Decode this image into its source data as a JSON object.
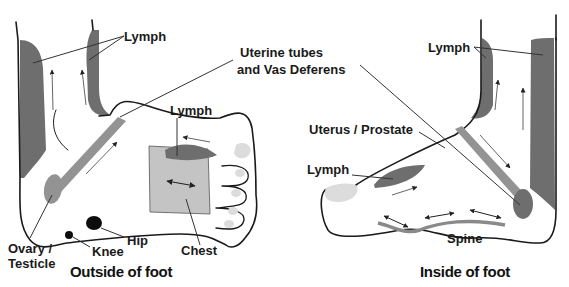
{
  "diagram": {
    "type": "reflexology-foot-map",
    "colors": {
      "lymph_dark": "#6e6e6e",
      "tube_mid": "#939393",
      "chest_light": "#c4c4c4",
      "toe_pad": "#dcdcdc",
      "outline": "#1a1a1a"
    },
    "shared_labels": {
      "uterine_tubes_line1": "Uterine tubes",
      "uterine_tubes_line2": "and Vas Deferens"
    },
    "outside_foot": {
      "title": "Outside of foot",
      "labels": {
        "lymph_ankle": "Lymph",
        "lymph_top": "Lymph",
        "ovary_line1": "Ovary /",
        "ovary_line2": "Testicle",
        "knee": "Knee",
        "hip": "Hip",
        "chest": "Chest"
      }
    },
    "inside_foot": {
      "title": "Inside of foot",
      "labels": {
        "lymph_ankle": "Lymph",
        "uterus": "Uterus / Prostate",
        "lymph_top": "Lymph",
        "spine": "Spine"
      }
    }
  }
}
